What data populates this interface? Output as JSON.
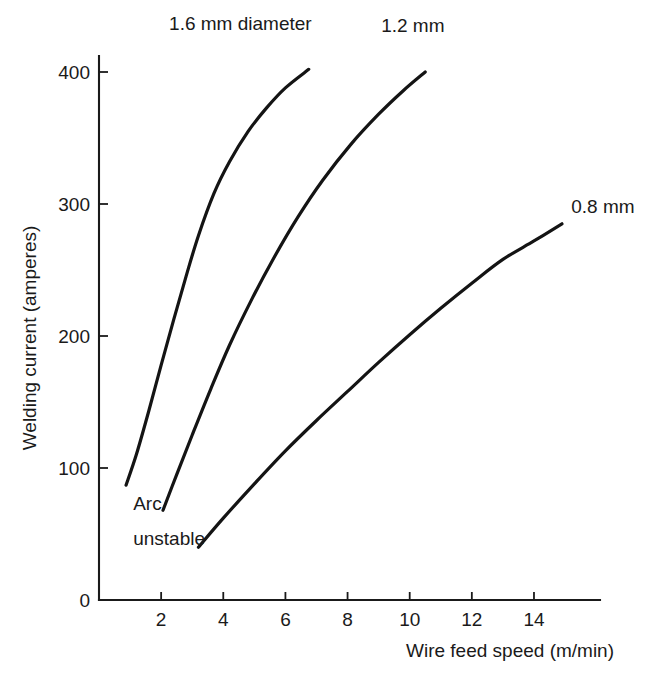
{
  "chart_data": {
    "type": "line",
    "title": "",
    "xlabel": "Wire feed speed (m/min)",
    "ylabel": "Welding current (amperes)",
    "xlim": [
      0,
      16
    ],
    "ylim": [
      0,
      420
    ],
    "grid": false,
    "legend_position": "inline-annotations",
    "xticks": [
      "2",
      "4",
      "6",
      "8",
      "10",
      "12",
      "14"
    ],
    "xtick_values": [
      2,
      4,
      6,
      8,
      10,
      12,
      14
    ],
    "yticks": [
      "0",
      "100",
      "200",
      "300",
      "400"
    ],
    "ytick_values": [
      0,
      100,
      200,
      300,
      400
    ],
    "annotations": [
      {
        "text": "Arc",
        "x": 1.1,
        "y": 68
      },
      {
        "text": "unstable",
        "x": 1.1,
        "y": 42
      }
    ],
    "series": [
      {
        "name": "1.6 mm diameter",
        "label": "1.6 mm diameter",
        "points": [
          [
            0.87,
            87
          ],
          [
            1.2,
            110
          ],
          [
            1.6,
            143
          ],
          [
            2.0,
            178
          ],
          [
            2.4,
            212
          ],
          [
            2.8,
            245
          ],
          [
            3.2,
            276
          ],
          [
            3.7,
            308
          ],
          [
            4.2,
            332
          ],
          [
            4.8,
            355
          ],
          [
            5.4,
            373
          ],
          [
            6.0,
            388
          ],
          [
            6.75,
            402
          ]
        ],
        "label_x": 4.55,
        "label_y": 432
      },
      {
        "name": "1.2 mm",
        "label": "1.2 mm",
        "points": [
          [
            2.06,
            68
          ],
          [
            2.5,
            95
          ],
          [
            3.0,
            125
          ],
          [
            3.6,
            160
          ],
          [
            4.2,
            193
          ],
          [
            4.9,
            227
          ],
          [
            5.6,
            258
          ],
          [
            6.4,
            290
          ],
          [
            7.2,
            318
          ],
          [
            8.1,
            345
          ],
          [
            9.0,
            368
          ],
          [
            9.8,
            386
          ],
          [
            10.5,
            400
          ]
        ],
        "label_x": 10.1,
        "label_y": 430
      },
      {
        "name": "0.8 mm",
        "label": "0.8 mm",
        "points": [
          [
            3.2,
            40
          ],
          [
            4.0,
            62
          ],
          [
            5.0,
            88
          ],
          [
            6.0,
            113
          ],
          [
            7.0,
            136
          ],
          [
            8.0,
            158
          ],
          [
            9.0,
            180
          ],
          [
            10.0,
            201
          ],
          [
            11.0,
            221
          ],
          [
            12.0,
            240
          ],
          [
            13.0,
            258
          ],
          [
            14.0,
            272
          ],
          [
            14.9,
            285
          ]
        ],
        "label_x": 15.2,
        "label_y": 293
      }
    ]
  },
  "axes": {
    "y_title": "Welding current (amperes)",
    "x_title": "Wire feed speed (m/min)"
  }
}
